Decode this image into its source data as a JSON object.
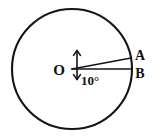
{
  "figure": {
    "kind": "geometry-diagram",
    "background_color": "#ffffff",
    "ink_color": "#141414",
    "canvas": {
      "width": 163,
      "height": 139
    }
  },
  "circle": {
    "name": "main-circle",
    "center_label": "O",
    "center_x": 72,
    "center_y": 69,
    "radius": 60,
    "stroke_width": 2.1
  },
  "points": [
    {
      "id": "center",
      "label": "O",
      "x": 72,
      "y": 69,
      "label_x": 59,
      "label_y": 75
    },
    {
      "id": "a",
      "label": "A",
      "x": 131,
      "y": 58,
      "label_x": 137,
      "label_y": 60
    },
    {
      "id": "b",
      "label": "B",
      "x": 132,
      "y": 69,
      "label_x": 137,
      "label_y": 78
    }
  ],
  "rays": [
    {
      "id": "ray-oa",
      "from": "center",
      "to": "a",
      "stroke_width": 1.7
    },
    {
      "id": "ray-ob",
      "from": "center",
      "to": "b",
      "stroke_width": 1.7
    }
  ],
  "angle": {
    "id": "central-angle-aob",
    "value": "10",
    "unit": "°",
    "text": "10°",
    "label_x": 81,
    "label_y": 85,
    "marker": {
      "type": "double-headed-arrow",
      "x": 77,
      "y_top": 51,
      "y_bottom": 79,
      "stroke_width": 1.6
    }
  },
  "labels": {
    "center": "O",
    "point_a": "A",
    "point_b": "B",
    "angle": "10°"
  }
}
